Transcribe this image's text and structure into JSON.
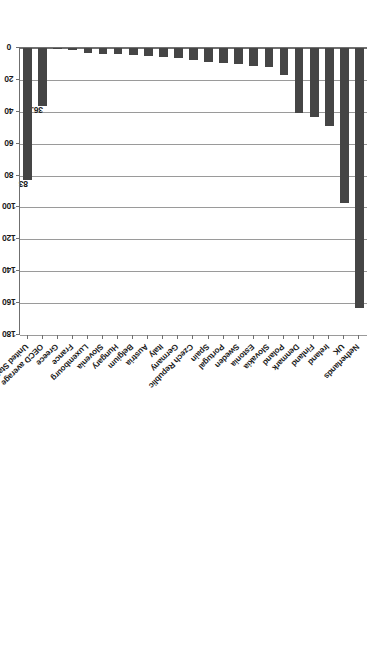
{
  "chart_data": {
    "type": "bar",
    "orientation": "horizontal",
    "title": "",
    "xlabel": "Percent of GDP",
    "ylabel": "",
    "xlim": [
      0,
      180
    ],
    "xticks": [
      0,
      20,
      40,
      60,
      80,
      100,
      120,
      140,
      160,
      180
    ],
    "xtick_labels": [
      "0",
      "20",
      "40",
      "60",
      "80",
      "100",
      "120",
      "140",
      "160",
      "180"
    ],
    "grid": true,
    "legend": null,
    "bar_color": "#454545",
    "gridline_color": "#9a9a9a",
    "axis_color": "#6f6f6f",
    "categories": [
      "Netherlands",
      "UK",
      "Ireland",
      "Finland",
      "Denmark",
      "Poland",
      "Slovakia",
      "Estonia",
      "Sweden",
      "Portugal",
      "Spain",
      "Czech Republic",
      "Germany",
      "Italy",
      "Austria",
      "Belgium",
      "Hungary",
      "Slovenia",
      "Luxembourg",
      "France",
      "Greece",
      "OECD average",
      "United States"
    ],
    "values": [
      163,
      97,
      49,
      43,
      41,
      17,
      12,
      11,
      10,
      9.5,
      8.5,
      7.5,
      6,
      5.5,
      5,
      4.5,
      4,
      3.5,
      3,
      1.2,
      0.3,
      36.6,
      83
    ],
    "data_labels": {
      "United States": "83",
      "OECD average": "36.6"
    },
    "annotations": []
  },
  "axis": {
    "value_axis_title": "Percent of GDP"
  }
}
